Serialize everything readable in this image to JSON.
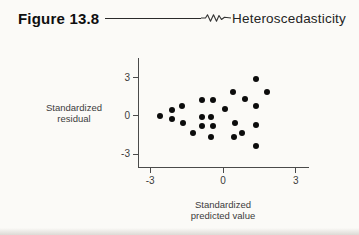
{
  "header": {
    "figure_label": "Figure 13.8",
    "topic": "Heteroscedasticity"
  },
  "chart_data": {
    "type": "scatter",
    "title": "Heteroscedasticity",
    "xlabel": "Standardized predicted value",
    "ylabel": "Standardized residual",
    "xlabel_lines": [
      "Standardized",
      "predicted value"
    ],
    "ylabel_lines": [
      "Standardized",
      "residual"
    ],
    "x_ticks": [
      -3,
      0,
      3
    ],
    "y_ticks": [
      3,
      0,
      -3
    ],
    "xlim": [
      -3.5,
      3.5
    ],
    "ylim": [
      -4.1,
      4.55
    ],
    "grid": false,
    "legend": "none",
    "marker": {
      "shape": "circle",
      "color": "#0c0c0c",
      "size_px": 6
    },
    "points": [
      [
        -2.6,
        0.0
      ],
      [
        -2.1,
        0.45
      ],
      [
        -2.1,
        -0.25
      ],
      [
        -1.7,
        0.8
      ],
      [
        -1.65,
        -0.6
      ],
      [
        -1.25,
        -1.35
      ],
      [
        -0.85,
        1.25
      ],
      [
        -0.4,
        1.25
      ],
      [
        -0.85,
        -0.1
      ],
      [
        -0.5,
        -0.1
      ],
      [
        -0.85,
        -0.8
      ],
      [
        -0.4,
        -0.8
      ],
      [
        -0.5,
        -1.65
      ],
      [
        0.1,
        0.55
      ],
      [
        0.4,
        1.9
      ],
      [
        0.9,
        1.35
      ],
      [
        1.35,
        2.9
      ],
      [
        1.8,
        1.9
      ],
      [
        1.35,
        0.8
      ],
      [
        0.5,
        -0.6
      ],
      [
        1.35,
        -0.7
      ],
      [
        0.8,
        -1.35
      ],
      [
        0.45,
        -1.65
      ],
      [
        1.35,
        -2.35
      ]
    ]
  },
  "colors": {
    "background": "#fbfaf7",
    "axis": "#4a4a4a",
    "dot": "#0c0c0c",
    "text": "#3c3c3c",
    "header_text": "#0f0f0f"
  }
}
